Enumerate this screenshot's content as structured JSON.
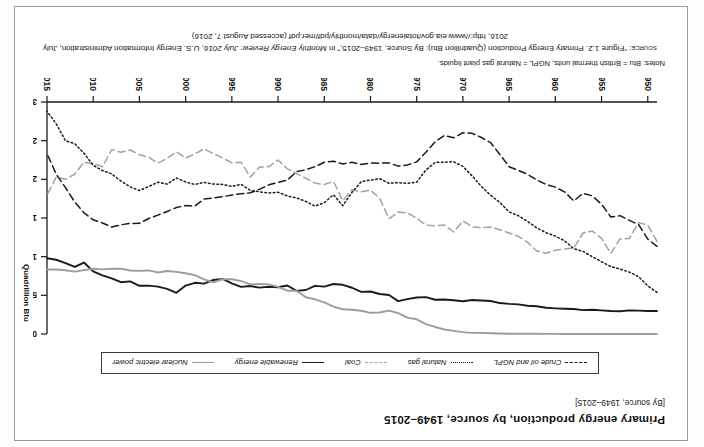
{
  "page": {
    "title": "Primary energy production, by source, 1949–2015",
    "subtitle": "[By source, 1949–2015]",
    "notes": "Notes: Btu = British thermal units, NGPL = Natural gas plant liquids.",
    "source_lead": "source:",
    "source_line1_a": "“Figure 1.2. Primary Energy Production (Quadrillion Btu): By Source, 1949–2015,” in ",
    "source_line1_italic": "Monthly Energy Review: July 2016",
    "source_line1_b": ", U.S. Energy",
    "source_line2": "Information Administration, July 2016, http://www.eia.gov/totalenergy/data/monthly/pdf/mer.pdf (accessed August 7, 2016)",
    "rotation_note": "180"
  },
  "legend": {
    "items": [
      {
        "label": "Crude oil and NGPL",
        "style": "sw-dash-dark",
        "color": "#1a1a1a"
      },
      {
        "label": "Natural gas",
        "style": "sw-dot-dark",
        "color": "#1a1a1a"
      },
      {
        "label": "Coal",
        "style": "sw-dash-gray",
        "color": "#a2a2a2"
      },
      {
        "label": "Renewable energy",
        "style": "sw-solid-dark",
        "color": "#1a1a1a"
      },
      {
        "label": "Nuclear electric power",
        "style": "sw-solid-gray",
        "color": "#9c9c9c"
      }
    ]
  },
  "axes": {
    "y_title": "Quadrillion Btu",
    "y_ticks": [
      0,
      5,
      10,
      15,
      20,
      25,
      30
    ],
    "x_ticks": [
      1950,
      1955,
      1960,
      1965,
      1970,
      1975,
      1980,
      1985,
      1990,
      1995,
      2000,
      2005,
      2010,
      2015
    ]
  },
  "chart_data": {
    "type": "line",
    "title": "Primary energy production, by source, 1949–2015",
    "xlabel": "",
    "ylabel": "Quadrillion Btu",
    "xlim": [
      1949,
      2015
    ],
    "ylim": [
      0,
      30
    ],
    "grid": false,
    "legend_position": "bottom",
    "x": [
      1949,
      1950,
      1951,
      1952,
      1953,
      1954,
      1955,
      1956,
      1957,
      1958,
      1959,
      1960,
      1961,
      1962,
      1963,
      1964,
      1965,
      1966,
      1967,
      1968,
      1969,
      1970,
      1971,
      1972,
      1973,
      1974,
      1975,
      1976,
      1977,
      1978,
      1979,
      1980,
      1981,
      1982,
      1983,
      1984,
      1985,
      1986,
      1987,
      1988,
      1989,
      1990,
      1991,
      1992,
      1993,
      1994,
      1995,
      1996,
      1997,
      1998,
      1999,
      2000,
      2001,
      2002,
      2003,
      2004,
      2005,
      2006,
      2007,
      2008,
      2009,
      2010,
      2011,
      2012,
      2013,
      2014,
      2015
    ],
    "series": [
      {
        "name": "Coal",
        "line_style": "dashed",
        "color": "#a2a2a2",
        "values": [
          11.97,
          14.06,
          14.43,
          12.34,
          12.28,
          10.43,
          12.37,
          13.31,
          13.06,
          11.11,
          11.0,
          10.82,
          10.45,
          10.73,
          11.85,
          12.62,
          13.06,
          13.47,
          13.83,
          13.77,
          13.86,
          14.61,
          13.19,
          14.09,
          13.99,
          14.07,
          14.99,
          15.65,
          15.76,
          14.91,
          17.54,
          18.6,
          18.38,
          18.64,
          17.25,
          19.72,
          19.33,
          19.51,
          20.14,
          20.74,
          21.36,
          22.49,
          21.64,
          21.59,
          20.29,
          22.2,
          22.13,
          22.79,
          23.31,
          23.94,
          23.3,
          22.74,
          23.55,
          22.73,
          22.09,
          22.85,
          23.19,
          23.79,
          23.49,
          23.85,
          21.62,
          22.04,
          22.22,
          20.68,
          20.0,
          20.29,
          17.95
        ]
      },
      {
        "name": "Crude oil and NGPL",
        "line_style": "dashed",
        "color": "#1a1a1a",
        "values": [
          11.34,
          12.27,
          14.16,
          14.7,
          15.3,
          15.13,
          16.78,
          17.86,
          18.2,
          17.2,
          18.38,
          18.99,
          19.33,
          19.91,
          20.64,
          21.16,
          21.62,
          23.22,
          24.74,
          25.41,
          25.95,
          26.02,
          25.37,
          25.67,
          24.87,
          23.5,
          22.26,
          21.86,
          21.71,
          22.12,
          22.09,
          22.12,
          21.92,
          22.2,
          21.99,
          22.34,
          22.21,
          21.63,
          21.24,
          20.99,
          19.9,
          19.61,
          19.29,
          18.71,
          18.26,
          18.13,
          17.97,
          17.75,
          17.6,
          17.45,
          16.54,
          16.61,
          16.35,
          15.84,
          15.37,
          14.93,
          14.31,
          14.3,
          14.12,
          13.84,
          14.35,
          14.77,
          15.67,
          17.07,
          18.93,
          20.66,
          23.33
        ]
      },
      {
        "name": "Natural gas",
        "line_style": "dotted",
        "color": "#1a1a1a",
        "values": [
          5.38,
          6.23,
          7.42,
          8.01,
          8.4,
          8.72,
          9.34,
          10.0,
          10.68,
          11.03,
          12.05,
          12.66,
          13.1,
          13.72,
          14.55,
          15.29,
          15.78,
          17.01,
          17.94,
          19.07,
          20.45,
          21.67,
          22.28,
          22.21,
          22.19,
          21.21,
          19.64,
          19.48,
          19.57,
          19.49,
          20.08,
          19.91,
          19.7,
          18.32,
          16.59,
          18.01,
          16.98,
          16.54,
          17.14,
          17.6,
          17.85,
          18.33,
          18.23,
          18.38,
          18.58,
          19.35,
          19.08,
          19.34,
          19.39,
          19.61,
          19.34,
          19.66,
          20.17,
          19.38,
          19.63,
          19.07,
          18.56,
          19.02,
          19.78,
          20.7,
          21.14,
          21.81,
          23.37,
          24.62,
          24.98,
          27.17,
          28.8
        ]
      },
      {
        "name": "Renewable energy",
        "line_style": "solid",
        "color": "#1a1a1a",
        "values": [
          2.97,
          2.98,
          3.02,
          3.05,
          2.94,
          2.97,
          3.05,
          3.14,
          3.09,
          3.24,
          3.27,
          3.32,
          3.39,
          3.59,
          3.65,
          3.83,
          3.9,
          4.0,
          4.27,
          4.33,
          4.4,
          4.23,
          4.36,
          4.47,
          4.43,
          4.77,
          4.72,
          4.51,
          4.25,
          5.04,
          5.17,
          5.49,
          5.45,
          5.98,
          6.36,
          6.47,
          6.13,
          6.22,
          5.69,
          5.58,
          6.27,
          6.04,
          6.11,
          6.0,
          6.2,
          6.1,
          6.56,
          7.12,
          6.99,
          6.52,
          6.62,
          6.26,
          5.33,
          5.84,
          6.13,
          6.26,
          6.23,
          6.8,
          6.7,
          7.19,
          7.59,
          8.09,
          9.24,
          8.67,
          9.15,
          9.6,
          9.79
        ]
      },
      {
        "name": "Nuclear electric power",
        "line_style": "solid",
        "color": "#9c9c9c",
        "values": [
          0.0,
          0.0,
          0.0,
          0.0,
          0.0,
          0.0,
          0.0,
          0.0,
          0.0,
          0.0,
          0.0,
          0.01,
          0.02,
          0.03,
          0.04,
          0.04,
          0.04,
          0.06,
          0.09,
          0.14,
          0.15,
          0.24,
          0.41,
          0.58,
          0.91,
          1.27,
          1.9,
          2.11,
          2.7,
          3.02,
          2.78,
          2.74,
          3.01,
          3.13,
          3.2,
          3.55,
          4.08,
          4.47,
          4.75,
          5.59,
          5.6,
          6.1,
          6.42,
          6.48,
          6.41,
          6.84,
          7.08,
          7.09,
          6.68,
          7.07,
          7.61,
          7.86,
          8.03,
          8.14,
          7.96,
          8.22,
          8.16,
          8.21,
          8.46,
          8.43,
          8.36,
          8.43,
          8.26,
          8.06,
          8.24,
          8.34,
          8.34
        ]
      }
    ]
  }
}
